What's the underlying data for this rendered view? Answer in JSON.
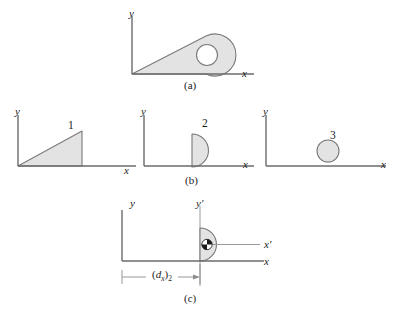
{
  "figure": {
    "background_color": "#ffffff",
    "line_color": "#6b6b6b",
    "shape_outline_color": "#7a7a7a",
    "shape_fill_color": "#e3e3e3",
    "text_color": "#1a1a1a"
  },
  "panels": [
    {
      "id": "a",
      "caption": "(a)",
      "axes": {
        "x_label": "x",
        "y_label": "y"
      },
      "shapes": [
        {
          "name": "composite-body",
          "type": "composite-outline",
          "fill": "#e3e3e3"
        },
        {
          "name": "circular-hole",
          "type": "circle-hole",
          "fill": "#ffffff"
        }
      ]
    },
    {
      "id": "b-left",
      "caption": "",
      "axes": {
        "x_label": "x",
        "y_label": "y"
      },
      "shapes": [
        {
          "name": "triangle",
          "type": "triangle",
          "label": "1",
          "fill": "#e3e3e3"
        }
      ]
    },
    {
      "id": "b",
      "caption": "(b)",
      "axes": {
        "x_label": "x",
        "y_label": "y"
      },
      "shapes": [
        {
          "name": "semicircle",
          "type": "semicircle",
          "label": "2",
          "fill": "#e3e3e3"
        }
      ]
    },
    {
      "id": "b-right",
      "caption": "",
      "axes": {
        "x_label": "x",
        "y_label": "y"
      },
      "shapes": [
        {
          "name": "circle",
          "type": "circle",
          "label": "3",
          "fill": "#e3e3e3"
        }
      ]
    },
    {
      "id": "c",
      "caption": "(c)",
      "axes": {
        "x_label": "x",
        "y_label": "y",
        "x_prime_label": "x′",
        "y_prime_label": "y′"
      },
      "shapes": [
        {
          "name": "semicircle",
          "type": "semicircle",
          "fill": "#e3e3e3"
        },
        {
          "name": "centroid-marker",
          "type": "centroid-symbol"
        }
      ],
      "dimension": {
        "name": "dx-2",
        "symbol": "d",
        "symbol_sub": "x",
        "group_sub": "2",
        "text": "(dx)2"
      }
    }
  ]
}
